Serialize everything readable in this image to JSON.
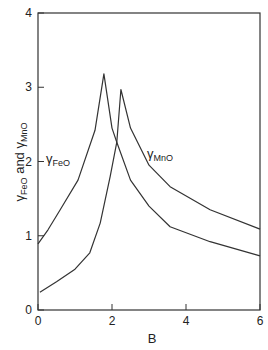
{
  "chart_data": {
    "type": "line",
    "title": "",
    "xlabel": "B",
    "ylabel_parts": {
      "gamma": "γ",
      "sub1": "FeO",
      "mid": " and ",
      "sub2": "MnO"
    },
    "ylabel": "γFeO and γMnO",
    "xlim": [
      0,
      6
    ],
    "ylim": [
      0,
      4
    ],
    "xticks": [
      "0",
      "2",
      "4",
      "6"
    ],
    "yticks": [
      "0",
      "1",
      "2",
      "3",
      "4"
    ],
    "grid": false,
    "legend": "inline labels",
    "series": [
      {
        "name": "γFeO",
        "label_gamma": "γ",
        "label_sub": "FeO",
        "points": [
          [
            0,
            0.89
          ],
          [
            0.27,
            1.08
          ],
          [
            0.6,
            1.35
          ],
          [
            1.08,
            1.75
          ],
          [
            1.54,
            2.42
          ],
          [
            1.78,
            3.18
          ],
          [
            2.0,
            2.45
          ],
          [
            2.13,
            2.26
          ],
          [
            2.5,
            1.75
          ],
          [
            3.0,
            1.4
          ],
          [
            3.57,
            1.12
          ],
          [
            4.65,
            0.92
          ],
          [
            6.0,
            0.73
          ]
        ]
      },
      {
        "name": "γMnO",
        "label_gamma": "γ",
        "label_sub": "MnO",
        "points": [
          [
            0.05,
            0.24
          ],
          [
            0.5,
            0.38
          ],
          [
            1.0,
            0.55
          ],
          [
            1.4,
            0.77
          ],
          [
            1.68,
            1.17
          ],
          [
            1.95,
            1.8
          ],
          [
            2.13,
            2.26
          ],
          [
            2.24,
            2.97
          ],
          [
            2.5,
            2.45
          ],
          [
            3.0,
            1.95
          ],
          [
            3.57,
            1.66
          ],
          [
            4.65,
            1.35
          ],
          [
            6.0,
            1.09
          ]
        ]
      }
    ]
  }
}
